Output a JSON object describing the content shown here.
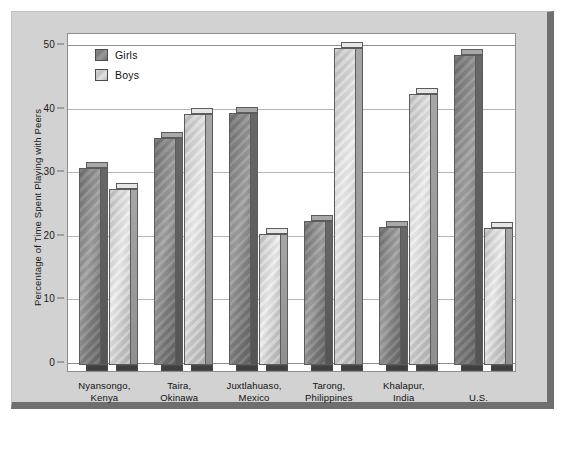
{
  "chart_data": {
    "type": "bar",
    "title": "",
    "xlabel": "",
    "ylabel": "Percentage of Time Spent Playing with Peers",
    "ylim": [
      0,
      50
    ],
    "yticks": [
      0,
      10,
      20,
      30,
      40,
      50
    ],
    "ytick_labels": [
      "0",
      "10",
      "20",
      "30",
      "40",
      "50"
    ],
    "grid": true,
    "legend_position": "top-left",
    "categories": [
      "Nyansongo, Kenya",
      "Taira, Okinawa",
      "Juxtlahuaso, Mexico",
      "Tarong, Philippines",
      "Khalapur, India",
      "U.S."
    ],
    "category_lines": [
      [
        "Nyansongo,",
        "Kenya"
      ],
      [
        "Taira,",
        "Okinawa"
      ],
      [
        "Juxtlahuaso,",
        "Mexico"
      ],
      [
        "Tarong,",
        "Philippines"
      ],
      [
        "Khalapur,",
        "India"
      ],
      [
        "U.S.",
        ""
      ]
    ],
    "series": [
      {
        "name": "Girls",
        "color": "#8a8a8a",
        "values": [
          31,
          35.7,
          39.7,
          22.7,
          21.7,
          48.7
        ]
      },
      {
        "name": "Boys",
        "color": "#d2d2d2",
        "values": [
          27.7,
          39.5,
          20.6,
          49.8,
          42.6,
          21.6
        ]
      }
    ]
  },
  "legend": {
    "items": [
      {
        "label": "Girls",
        "key": "girls"
      },
      {
        "label": "Boys",
        "key": "boys"
      }
    ]
  },
  "colors": {
    "figure_background": "#d2d2d2",
    "plot_background": "#ffffff",
    "gridline": "#b4b4b4",
    "axis": "#8d8d8d",
    "shadow": "#6f6f6f",
    "text": "#111111"
  }
}
